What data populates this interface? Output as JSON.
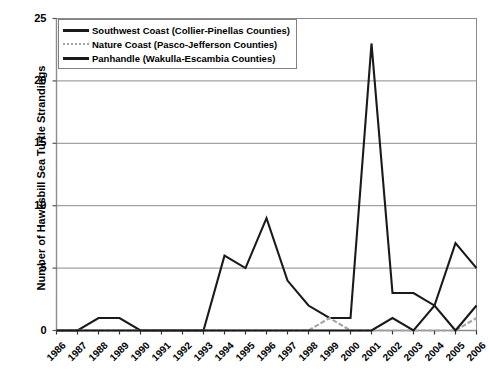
{
  "chart_data": {
    "type": "line",
    "title": "",
    "xlabel": "",
    "ylabel": "Number of Hawksbill Sea Turtle Strandings",
    "ylim": [
      0,
      25
    ],
    "ytick_labels": [
      "0",
      "5",
      "10",
      "15",
      "20",
      "25"
    ],
    "yticks": [
      0,
      5,
      10,
      15,
      20,
      25
    ],
    "grid": true,
    "legend_position": "top-left",
    "categories": [
      "1986",
      "1987",
      "1988",
      "1989",
      "1990",
      "1991",
      "1992",
      "1993",
      "1994",
      "1995",
      "1996",
      "1997",
      "1998",
      "1999",
      "2000",
      "2001",
      "2002",
      "2003",
      "2004",
      "2005",
      "2006"
    ],
    "x": [
      1986,
      1987,
      1988,
      1989,
      1990,
      1991,
      1992,
      1993,
      1994,
      1995,
      1996,
      1997,
      1998,
      1999,
      2000,
      2001,
      2002,
      2003,
      2004,
      2005,
      2006
    ],
    "series": [
      {
        "name": "Southwest Coast (Collier-Pinellas Counties)",
        "color": "#1a1a1a",
        "style": "solid",
        "values": [
          0,
          0,
          1,
          1,
          0,
          0,
          0,
          0,
          6,
          5,
          9,
          4,
          2,
          1,
          1,
          23,
          3,
          3,
          2,
          7,
          5
        ]
      },
      {
        "name": "Nature Coast (Pasco-Jefferson Counties)",
        "color": "#a6a6a6",
        "style": "dashed",
        "values": [
          0,
          0,
          0,
          0,
          0,
          0,
          0,
          0,
          0,
          0,
          0,
          0,
          0,
          1,
          0,
          0,
          0,
          0,
          0,
          0,
          1
        ]
      },
      {
        "name": "Panhandle (Wakulla-Escambia Counties)",
        "color": "#1a1a1a",
        "style": "solid",
        "values": [
          0,
          0,
          0,
          0,
          0,
          0,
          0,
          0,
          0,
          0,
          0,
          0,
          0,
          0,
          0,
          0,
          1,
          0,
          2,
          0,
          2
        ]
      }
    ]
  },
  "legend": {
    "items": [
      {
        "label": "Southwest Coast (Collier-Pinellas Counties)"
      },
      {
        "label": "Nature Coast (Pasco-Jefferson Counties)"
      },
      {
        "label": "Panhandle (Wakulla-Escambia Counties)"
      }
    ]
  }
}
